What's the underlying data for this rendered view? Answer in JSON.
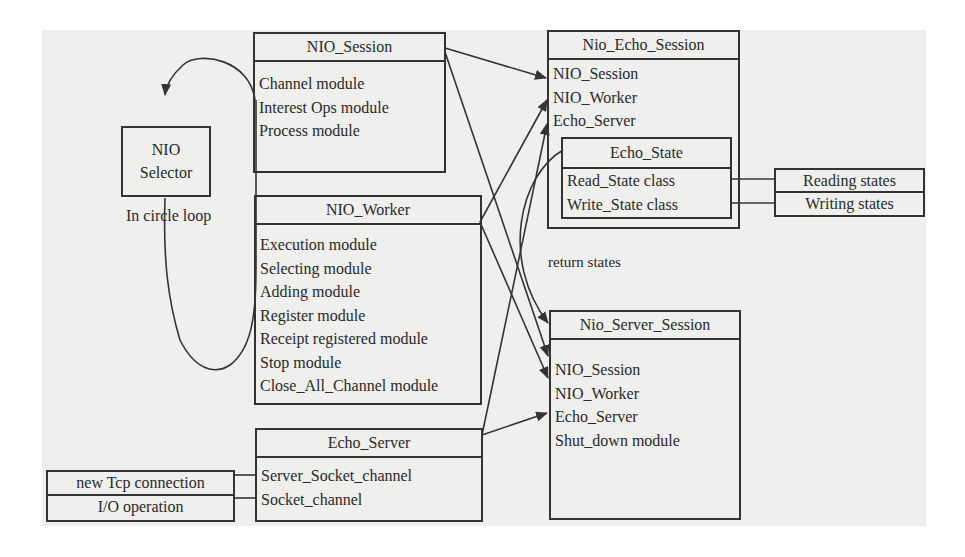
{
  "diagram": {
    "nodes": {
      "nio_selector": {
        "title_lines": [
          "NIO",
          "Selector"
        ],
        "loop_label": "In circle loop"
      },
      "nio_session": {
        "title": "NIO_Session",
        "items": [
          "Channel module",
          "Interest Ops module",
          "Process module"
        ]
      },
      "nio_worker": {
        "title": "NIO_Worker",
        "items": [
          "Execution module",
          "Selecting module",
          "Adding module",
          "Register module",
          "Receipt registered module",
          "Stop module",
          "Close_All_Channel module"
        ]
      },
      "echo_server": {
        "title": "Echo_Server",
        "items": [
          "Server_Socket_channel",
          "Socket_channel"
        ]
      },
      "io_events": {
        "items": [
          "new Tcp connection",
          "I/O operation"
        ]
      },
      "nio_echo_session": {
        "title": "Nio_Echo_Session",
        "items": [
          "NIO_Session",
          "NIO_Worker",
          "Echo_Server"
        ]
      },
      "echo_state": {
        "title": "Echo_State",
        "items": [
          "Read_State class",
          "Write_State class"
        ]
      },
      "states": {
        "items": [
          "Reading states",
          "Writing states"
        ]
      },
      "nio_server_session": {
        "title": "Nio_Server_Session",
        "items": [
          "NIO_Session",
          "NIO_Worker",
          "Echo_Server",
          "Shut_down module"
        ]
      }
    },
    "annotations": {
      "return_states": "return states"
    },
    "colors": {
      "line": "#333333",
      "paper": "#efefed",
      "background": "#ffffff"
    }
  }
}
